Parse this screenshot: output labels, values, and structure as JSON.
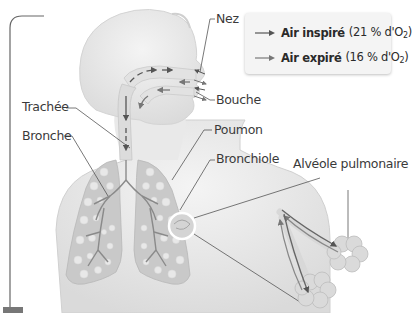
{
  "legend": {
    "items": [
      {
        "label": "Air inspiré",
        "detail": "(21 % d'O",
        "sub": "2",
        "close": ")",
        "arrow_color": "#555555",
        "icon": "arrow-right-icon"
      },
      {
        "label": "Air expiré",
        "detail": "(16 % d'O",
        "sub": "2",
        "close": ")",
        "arrow_color": "#777777",
        "icon": "arrow-right-icon"
      }
    ]
  },
  "labels": {
    "nez": "Nez",
    "bouche": "Bouche",
    "trachee": "Trachée",
    "bronche": "Bronche",
    "poumon": "Poumon",
    "bronchiole": "Bronchiole",
    "alveole": "Alvéole pulmonaire"
  },
  "colors": {
    "body": "#ececec",
    "body_shadow": "#d6d6d6",
    "lung": "#c9c9c9",
    "alveoli": "#e6e6e6",
    "airway": "#8a8a8a",
    "leader_line": "#555555",
    "frame": "#555555"
  }
}
